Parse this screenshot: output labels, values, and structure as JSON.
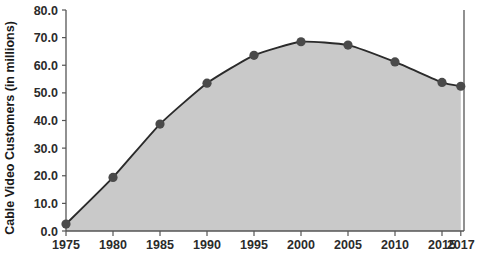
{
  "chart_data": {
    "type": "area",
    "title": "",
    "subtitle": "",
    "xlabel": "",
    "ylabel": "Cable Video Customers (in millions)",
    "x": [
      1975,
      1980,
      1985,
      1990,
      1995,
      2000,
      2005,
      2010,
      2015,
      2017
    ],
    "values": [
      2.5,
      19.4,
      38.7,
      53.5,
      63.6,
      68.5,
      67.3,
      61.2,
      53.8,
      52.4
    ],
    "categories": [
      "1975",
      "1980",
      "1985",
      "1990",
      "1995",
      "2000",
      "2005",
      "2010",
      "2015",
      "2017"
    ],
    "xtick_labels": [
      "1975",
      "1980",
      "1985",
      "1990",
      "1995",
      "2000",
      "2005",
      "2010",
      "2015",
      "2017"
    ],
    "ytick_labels": [
      "0.0",
      "10.0",
      "20.0",
      "30.0",
      "40.0",
      "50.0",
      "60.0",
      "70.0",
      "80.0"
    ],
    "ytick_values": [
      0,
      10,
      20,
      30,
      40,
      50,
      60,
      70,
      80
    ],
    "ylim": [
      0,
      80
    ],
    "xlim": [
      1975,
      2017
    ],
    "grid": false,
    "legend": "none",
    "marker": "circle",
    "colors": {
      "area_fill": "#c9c9c9",
      "line": "#2b2b2b",
      "marker": "#4a4a4a",
      "axis": "#555555",
      "text": "#1a1a1a",
      "background": "#ffffff"
    }
  }
}
